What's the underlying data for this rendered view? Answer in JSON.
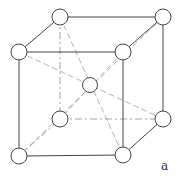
{
  "diagram": {
    "label": "a",
    "nodes": [
      {
        "id": "top-back-left",
        "x": 60,
        "y": 17
      },
      {
        "id": "top-back-right",
        "x": 163,
        "y": 17
      },
      {
        "id": "top-front-left",
        "x": 19,
        "y": 52
      },
      {
        "id": "top-front-right",
        "x": 123,
        "y": 52
      },
      {
        "id": "bottom-back-left",
        "x": 60,
        "y": 119
      },
      {
        "id": "bottom-back-right",
        "x": 163,
        "y": 119
      },
      {
        "id": "bottom-front-left",
        "x": 19,
        "y": 156
      },
      {
        "id": "bottom-front-right",
        "x": 123,
        "y": 155
      },
      {
        "id": "body-center",
        "x": 90,
        "y": 85
      }
    ],
    "node_radius": 8,
    "colors": {
      "edge": "#444444",
      "hidden": "#999999",
      "diagonal": "#aaaaaa",
      "atom_fill": "#ffffff"
    }
  }
}
